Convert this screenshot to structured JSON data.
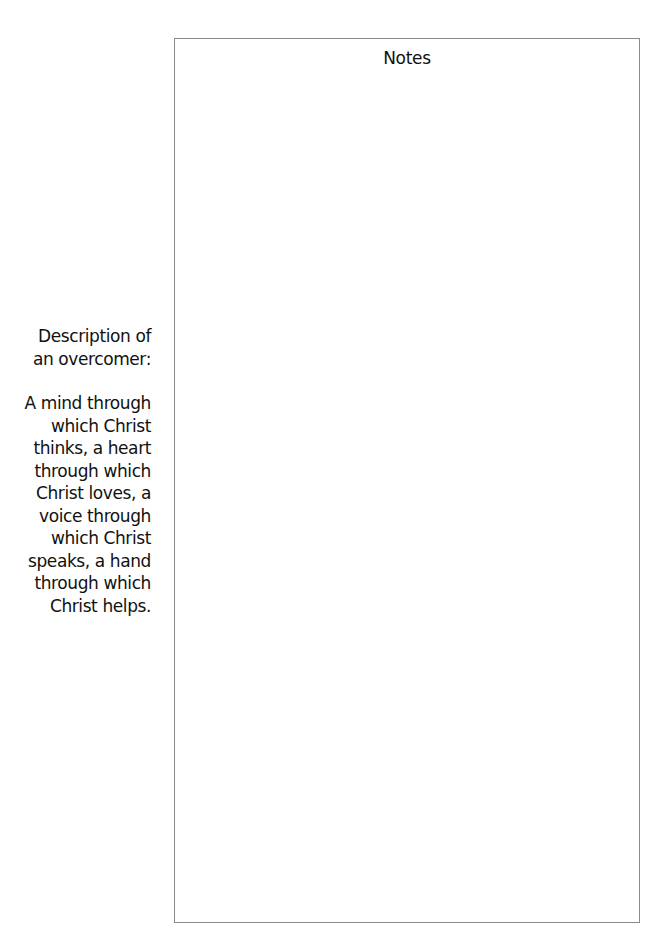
{
  "sidebar": {
    "heading_lines": [
      "Description of",
      "an overcomer:"
    ],
    "body_lines": [
      "A mind through",
      "which Christ",
      "thinks, a heart",
      "through which",
      "Christ loves, a",
      "voice through",
      "which Christ",
      "speaks, a hand",
      "through which",
      "Christ helps."
    ]
  },
  "notes": {
    "title": "Notes",
    "content": ""
  },
  "colors": {
    "text": "#111111",
    "border": "#8a8a8a",
    "background": "#ffffff"
  }
}
